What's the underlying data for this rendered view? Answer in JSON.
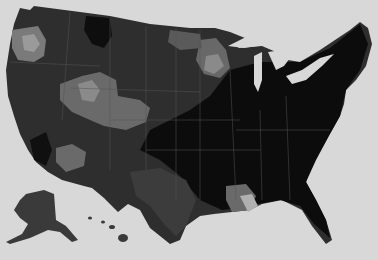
{
  "map": {
    "type": "choropleth",
    "region": "United States",
    "palette": {
      "background": "#d8d8d8",
      "land_base": "#2e2e2e",
      "darkest": "#0c0c0c",
      "dark": "#1e1e1e",
      "mid": "#4a4a4a",
      "light": "#6e6e6e",
      "lighter": "#8c8c8c",
      "lightest": "#b4b4b4",
      "borders": "#5a5a5a"
    }
  }
}
